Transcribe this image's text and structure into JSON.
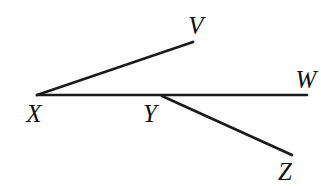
{
  "figure": {
    "type": "geometry-ray-diagram",
    "background_color": "#ffffff",
    "stroke_color": "#1b1b1b",
    "stroke_width": 2.7,
    "text_color": "#121212",
    "points": {
      "X": {
        "x": 37,
        "y": 95
      },
      "Y": {
        "x": 162,
        "y": 96
      },
      "V": {
        "x": 193,
        "y": 42
      },
      "W": {
        "x": 307,
        "y": 95
      },
      "Z": {
        "x": 292,
        "y": 155
      }
    },
    "segments": [
      {
        "name": "ray-X-to-V",
        "x1": 37,
        "y1": 95,
        "x2": 193,
        "y2": 42
      },
      {
        "name": "ray-X-to-W",
        "x1": 37,
        "y1": 95,
        "x2": 307,
        "y2": 95
      },
      {
        "name": "ray-Y-to-Z",
        "x1": 162,
        "y1": 96,
        "x2": 292,
        "y2": 155
      }
    ],
    "labels": [
      {
        "point": "V",
        "text": "V",
        "x": 196,
        "y": 34
      },
      {
        "point": "W",
        "text": "W",
        "x": 306,
        "y": 88
      },
      {
        "point": "X",
        "text": "X",
        "x": 34,
        "y": 122
      },
      {
        "point": "Y",
        "text": "Y",
        "x": 150,
        "y": 122
      },
      {
        "point": "Z",
        "text": "Z",
        "x": 285,
        "y": 180
      }
    ]
  }
}
